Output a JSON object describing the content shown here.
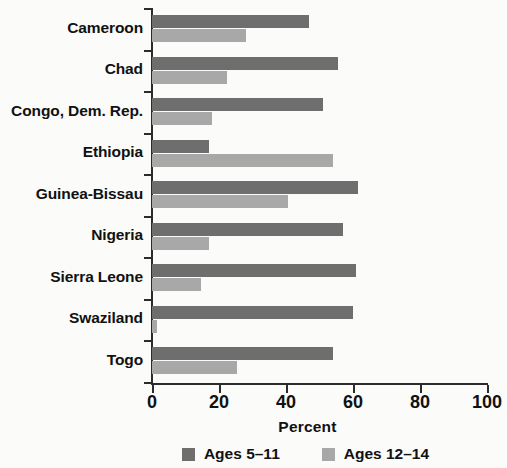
{
  "chart_data": {
    "type": "bar",
    "orientation": "horizontal",
    "title": "",
    "xlabel": "Percent",
    "ylabel": "",
    "xlim": [
      0,
      100
    ],
    "xticks": [
      0,
      20,
      40,
      60,
      80,
      100
    ],
    "xtick_labels": [
      "0",
      "20",
      "40",
      "60",
      "80",
      "100"
    ],
    "grid": false,
    "legend_position": "bottom",
    "categories": [
      "Cameroon",
      "Chad",
      "Congo, Dem. Rep.",
      "Ethiopia",
      "Guinea-Bissau",
      "Nigeria",
      "Sierra Leone",
      "Swaziland",
      "Togo"
    ],
    "series": [
      {
        "name": "Ages 5–11",
        "color": "#6e6e6e",
        "values": [
          47,
          55.5,
          51,
          17,
          61.5,
          57,
          61,
          60,
          54
        ]
      },
      {
        "name": "Ages 12–14",
        "color": "#a8a8a8",
        "values": [
          28,
          22.5,
          18,
          54,
          40.5,
          17,
          14.5,
          1.5,
          25.5
        ]
      }
    ]
  },
  "colors": {
    "series_dark": "#6e6e6e",
    "series_light": "#a8a8a8",
    "axis": "#2b2b2b",
    "text": "#111111",
    "background": "#fbfbf9"
  }
}
